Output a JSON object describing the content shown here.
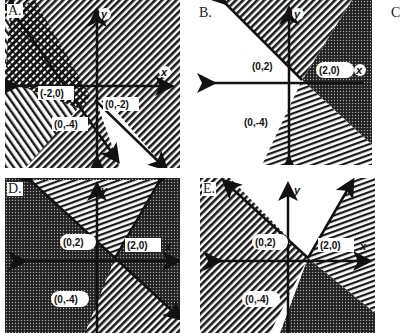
{
  "panels": [
    {
      "id": "A",
      "label": "A.",
      "axis_x": "x",
      "axis_y": "y",
      "points": [
        "(-2,0)",
        "(0,-2)",
        "(0,-4)"
      ]
    },
    {
      "id": "B",
      "label": "B.",
      "axis_x": "x",
      "axis_y": "y",
      "points": [
        "(0,2)",
        "(2,0)",
        "(0,-4)"
      ]
    },
    {
      "id": "C",
      "label": "C"
    },
    {
      "id": "D",
      "label": "D.",
      "axis_x": "x",
      "axis_y": "y",
      "points": [
        "(0,2)",
        "(2,0)",
        "(0,-4)"
      ]
    },
    {
      "id": "E",
      "label": "E.",
      "axis_x": "x",
      "axis_y": "y",
      "points": [
        "(0,2)",
        "(2,0)",
        "(0,-4)"
      ]
    }
  ],
  "colors": {
    "ink": "#111111",
    "paper": "#ffffff"
  }
}
